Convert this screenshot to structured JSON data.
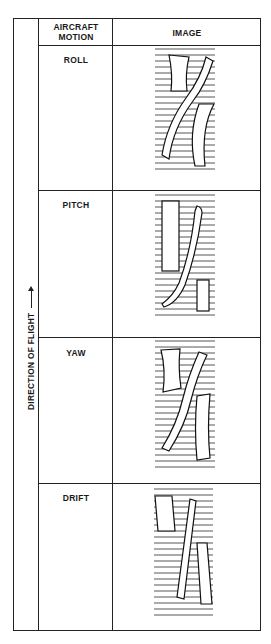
{
  "table": {
    "headers": {
      "direction_col": "",
      "motion_col": "AIRCRAFT MOTION",
      "image_col": "IMAGE"
    },
    "side_label": "DIRECTION OF FLIGHT",
    "side_arrow": "arrow-up",
    "rows": [
      {
        "motion": "ROLL",
        "image": "roll-distortion-diagram"
      },
      {
        "motion": "PITCH",
        "image": "pitch-distortion-diagram"
      },
      {
        "motion": "YAW",
        "image": "yaw-distortion-diagram"
      },
      {
        "motion": "DRIFT",
        "image": "drift-distortion-diagram"
      }
    ]
  },
  "colors": {
    "line": "#222222",
    "scanline": "#444444",
    "background": "#ffffff"
  }
}
